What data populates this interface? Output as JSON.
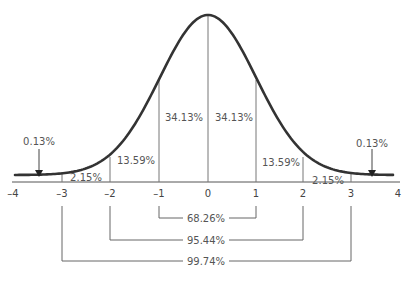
{
  "chart_data": {
    "type": "area",
    "xlabel": "",
    "ylabel": "",
    "x_ticks": [
      "-4",
      "-3",
      "-2",
      "-1",
      "0",
      "1",
      "2",
      "3",
      "4"
    ],
    "xlim": [
      -4,
      4
    ],
    "grid": false,
    "regions": [
      {
        "from": "-inf",
        "to": -3,
        "percent": "0.13%"
      },
      {
        "from": -3,
        "to": -2,
        "percent": "2.15%"
      },
      {
        "from": -2,
        "to": -1,
        "percent": "13.59%"
      },
      {
        "from": -1,
        "to": 0,
        "percent": "34.13%"
      },
      {
        "from": 0,
        "to": 1,
        "percent": "34.13%"
      },
      {
        "from": 1,
        "to": 2,
        "percent": "13.59%"
      },
      {
        "from": 2,
        "to": 3,
        "percent": "2.15%"
      },
      {
        "from": 3,
        "to": "inf",
        "percent": "0.13%"
      }
    ],
    "ranges": [
      {
        "from": -1,
        "to": 1,
        "percent": "68.26%"
      },
      {
        "from": -2,
        "to": 2,
        "percent": "95.44%"
      },
      {
        "from": -3,
        "to": 3,
        "percent": "99.74%"
      }
    ]
  },
  "labels": {
    "tail_left": "0.13%",
    "tail_right": "0.13%",
    "r_m3_m2": "2.15%",
    "r_m2_m1": "13.59%",
    "r_m1_0": "34.13%",
    "r_0_1": "34.13%",
    "r_1_2": "13.59%",
    "r_2_3": "2.15%",
    "range_1sd": "68.26%",
    "range_2sd": "95.44%",
    "range_3sd": "99.74%"
  },
  "ticks": [
    "–4",
    "–3",
    "–2",
    "–1",
    "0",
    "1",
    "2",
    "3",
    "4"
  ],
  "colors": {
    "curve": "#333333",
    "lines": "#666666",
    "text": "#555555"
  }
}
